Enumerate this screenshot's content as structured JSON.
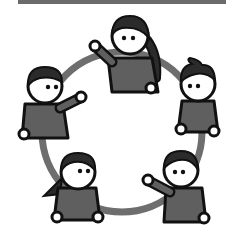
{
  "illustration": {
    "title": "",
    "description": "Five cartoon people standing around a circle, waving",
    "colors": {
      "background": "#ffffff",
      "ring": "#6e6e6e",
      "body": "#5f5f5f",
      "outline": "#111111",
      "hair": "#2b2b2b",
      "face": "#ffffff",
      "topbar": "#6b6b6b"
    },
    "ring": {
      "cx": 122,
      "cy": 132,
      "r": 80
    },
    "people": [
      {
        "id": "top",
        "style": "long-hair",
        "head": [
          130,
          35
        ]
      },
      {
        "id": "left",
        "style": "short-hair",
        "head": [
          45,
          86
        ]
      },
      {
        "id": "right",
        "style": "bun-hair",
        "head": [
          198,
          84
        ]
      },
      {
        "id": "bottom-left",
        "style": "ponytail",
        "head": [
          78,
          172
        ]
      },
      {
        "id": "bottom-right",
        "style": "short-hair",
        "head": [
          181,
          170
        ]
      }
    ]
  }
}
